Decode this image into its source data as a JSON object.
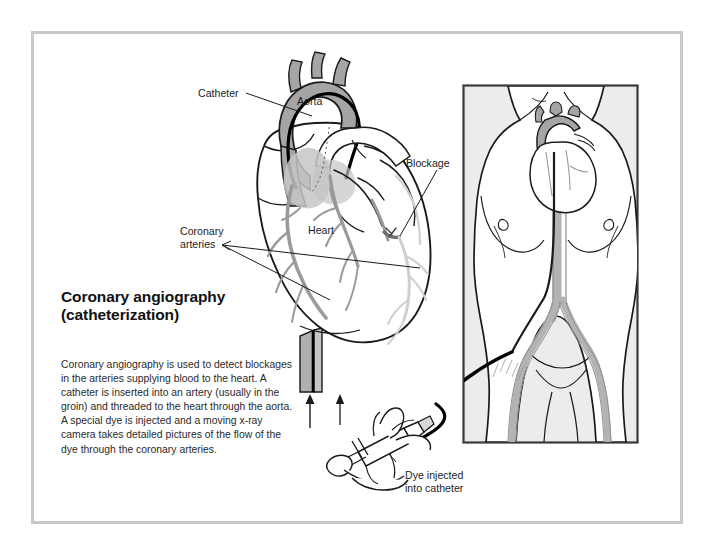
{
  "figure": {
    "kind": "medical-illustration",
    "title_line1": "Coronary angiography",
    "title_line2": "(catheterization)",
    "description": "Coronary angiography is used to detect blockages in the arteries supplying blood to the heart. A catheter is inserted into an artery (usually in the groin) and threaded to the heart through the aorta. A special dye is injected and a moving x-ray camera takes detailed pictures of the flow of the dye through the coronary arteries.",
    "labels": {
      "catheter": "Catheter",
      "aorta": "Aorta",
      "blockage": "Blockage",
      "coronary_arteries_line1": "Coronary",
      "coronary_arteries_line2": "arteries",
      "heart": "Heart",
      "dye_line1": "Dye injected",
      "dye_line2": "into catheter"
    },
    "colors": {
      "frame_border": "#c9c9c9",
      "page_background": "#ffffff",
      "aorta_fill": "#a5a5a5",
      "vessel_gray": "#9a9a9a",
      "vessel_light_gray": "#cfcfcf",
      "outline": "#1a1a1a",
      "panel_background": "#ececec",
      "panel_border": "#3a3a3a",
      "catheter_black": "#000000",
      "text": "#1c1c1c"
    },
    "panels": {
      "heart_detail": {
        "name": "heart-with-aorta-and-coronary-arteries",
        "shows": [
          "aortic arch",
          "catheter in aorta",
          "coronary arteries",
          "blockage site",
          "descending aorta"
        ]
      },
      "body_view": {
        "name": "torso-with-catheter-path",
        "shows": [
          "upper torso",
          "heart in chest",
          "descending aorta",
          "aortic bifurcation",
          "femoral arteries",
          "catheter inserted at groin"
        ]
      },
      "syringe_detail": {
        "name": "hand-injecting-syringe",
        "shows": [
          "hand",
          "syringe",
          "catheter hub",
          "direction arrow"
        ]
      }
    }
  }
}
